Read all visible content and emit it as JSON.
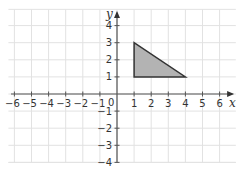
{
  "chart_data": {
    "type": "diagram",
    "title": "",
    "xlabel": "x",
    "ylabel": "y",
    "xlim": [
      -6,
      6
    ],
    "ylim": [
      -4,
      4
    ],
    "grid": true,
    "x_ticks": [
      "−6",
      "−5",
      "−4",
      "−3",
      "−2",
      "−1",
      "1",
      "2",
      "3",
      "4",
      "5",
      "6"
    ],
    "y_ticks": [
      "4",
      "3",
      "2",
      "1",
      "−1",
      "−2",
      "−3",
      "−4"
    ],
    "origin_label": "0",
    "shapes": [
      {
        "type": "triangle",
        "vertices": [
          [
            1,
            1
          ],
          [
            1,
            3
          ],
          [
            4,
            1
          ]
        ],
        "fill": "#b3b3b3",
        "stroke": "#333333"
      }
    ]
  },
  "colors": {
    "grid": "#e2e2e2",
    "axis": "#555555",
    "shape_fill": "#b3b3b3",
    "shape_stroke": "#333333"
  }
}
